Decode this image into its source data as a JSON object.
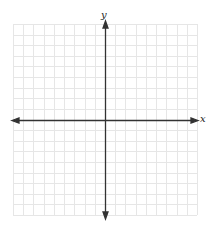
{
  "figure": {
    "type": "coordinate-plane",
    "x_axis_label": "x",
    "y_axis_label": "y",
    "grid": {
      "columns": 18,
      "rows": 18,
      "origin_col": 9,
      "origin_row": 9
    },
    "colors": {
      "grid": "#e6e6e6",
      "axis": "#333333",
      "background": "#ffffff"
    }
  },
  "top_text_cut": "ancestors of a line above (text cut off)"
}
